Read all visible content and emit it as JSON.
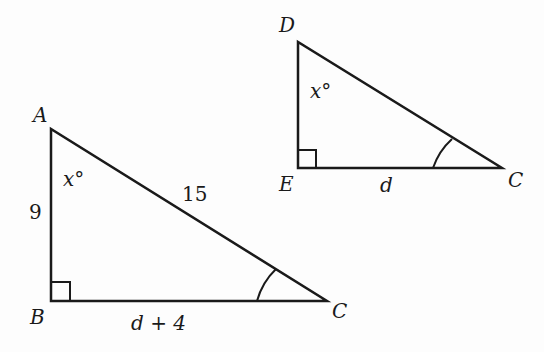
{
  "diagram": {
    "triangle_abc": {
      "vertices": {
        "A": "A",
        "B": "B",
        "C": "C"
      },
      "side_ab": "9",
      "side_ac": "15",
      "side_bc": "d + 4",
      "angle_a": "x°"
    },
    "triangle_dec": {
      "vertices": {
        "D": "D",
        "E": "E",
        "C": "C"
      },
      "side_ec": "d",
      "angle_d": "x°"
    },
    "colors": {
      "stroke": "#1a1a1a",
      "background": "#fdfdfd"
    }
  }
}
